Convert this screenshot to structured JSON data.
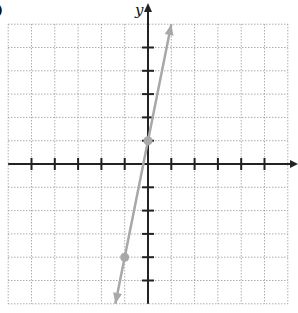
{
  "figure": {
    "part_label": ")",
    "y_axis_label": "y",
    "x_axis_label": ""
  },
  "colors": {
    "axis": "#222222",
    "grid": "#9a9a9a",
    "line": "#a8a8a8",
    "point": "#a8a8a8"
  },
  "chart_data": {
    "type": "line",
    "title": "",
    "xlabel": "x",
    "ylabel": "y",
    "xlim": [
      -6,
      6
    ],
    "ylim": [
      -6,
      6
    ],
    "grid": true,
    "grid_style": "dotted",
    "legend": null,
    "series": [
      {
        "name": "y = 5x + 1",
        "equation": "y = 5x + 1",
        "slope": 5,
        "intercept": 1,
        "arrows_both_ends": true,
        "x": [
          -1.4,
          1.0
        ],
        "y": [
          -6.0,
          6.0
        ]
      }
    ],
    "points": [
      {
        "x": 0,
        "y": 1,
        "label": "y-intercept"
      },
      {
        "x": -1,
        "y": -4,
        "label": "second point"
      }
    ],
    "x_ticks": [
      -5,
      -4,
      -3,
      -2,
      -1,
      1,
      2,
      3,
      4,
      5
    ],
    "y_ticks": [
      -5,
      -4,
      -3,
      -2,
      -1,
      1,
      2,
      3,
      4,
      5
    ]
  }
}
